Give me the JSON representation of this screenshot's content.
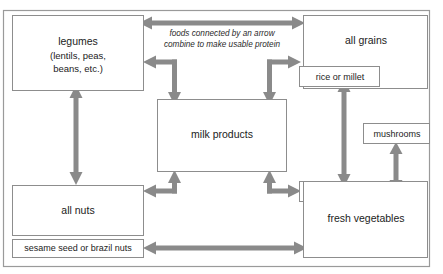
{
  "diagram": {
    "caption": {
      "line1": "foods connected by an arrow",
      "line2": "combine to make usable protein"
    },
    "colors": {
      "arrow": "#8a8a8a",
      "box_border": "#8d8d8d",
      "frame_border": "#9a9a9a",
      "text": "#1b1b1b",
      "background": "#ffffff"
    },
    "nodes": {
      "legumes": {
        "line1": "legumes",
        "line2": "(lentils, peas,",
        "line3": "beans, etc.)"
      },
      "all_grains": {
        "label": "all grains"
      },
      "rice_or_millet": {
        "label": "rice or millet"
      },
      "mushrooms": {
        "label": "mushrooms"
      },
      "milk_products": {
        "label": "milk products"
      },
      "potato": {
        "label": "potato"
      },
      "fresh_vegetables": {
        "label": "fresh vegetables"
      },
      "all_nuts": {
        "label": "all nuts"
      },
      "sesame_seed_or_brazil_nuts": {
        "label": "sesame seed or brazil nuts"
      }
    },
    "connections": [
      {
        "from": "legumes",
        "to": "all grains",
        "style": "double-headed"
      },
      {
        "from": "legumes",
        "to": "milk products",
        "style": "elbow-double"
      },
      {
        "from": "all grains",
        "to": "milk products",
        "style": "elbow-double"
      },
      {
        "from": "legumes",
        "to": "all nuts",
        "style": "double-headed"
      },
      {
        "from": "rice or millet",
        "to": "potato",
        "style": "double-headed"
      },
      {
        "from": "mushrooms",
        "to": "fresh vegetables",
        "style": "double-headed"
      },
      {
        "from": "all nuts",
        "to": "milk products",
        "style": "elbow-double"
      },
      {
        "from": "potato",
        "to": "milk products",
        "style": "elbow-double"
      },
      {
        "from": "sesame seed or brazil nuts",
        "to": "fresh vegetables",
        "style": "double-headed"
      }
    ]
  }
}
